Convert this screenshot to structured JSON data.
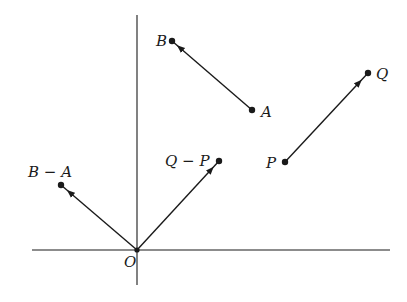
{
  "diagram": {
    "type": "vector-diagram",
    "colors": {
      "ink": "#1a1a1a",
      "background": "#ffffff"
    },
    "axes": {
      "origin_label": "O",
      "origin": [
        137,
        250
      ],
      "x_axis": {
        "from": [
          32,
          250
        ],
        "to": [
          390,
          250
        ]
      },
      "y_axis": {
        "from": [
          137,
          15
        ],
        "to": [
          137,
          285
        ]
      }
    },
    "points": {
      "A": {
        "label": "A",
        "pos": [
          252,
          110
        ]
      },
      "B": {
        "label": "B",
        "pos": [
          172,
          41
        ]
      },
      "P": {
        "label": "P",
        "pos": [
          285,
          162
        ]
      },
      "Q": {
        "label": "Q",
        "pos": [
          368,
          73
        ]
      },
      "BminusA": {
        "label": "B − A",
        "pos": [
          61,
          185
        ]
      },
      "QminusP": {
        "label": "Q − P",
        "pos": [
          219,
          161
        ]
      }
    },
    "vectors": [
      {
        "name": "A-to-B",
        "from": "A",
        "to": "B"
      },
      {
        "name": "P-to-Q",
        "from": "P",
        "to": "Q"
      },
      {
        "name": "O-to-B-minus-A",
        "from": "O",
        "to": "BminusA"
      },
      {
        "name": "O-to-Q-minus-P",
        "from": "O",
        "to": "QminusP"
      }
    ]
  }
}
